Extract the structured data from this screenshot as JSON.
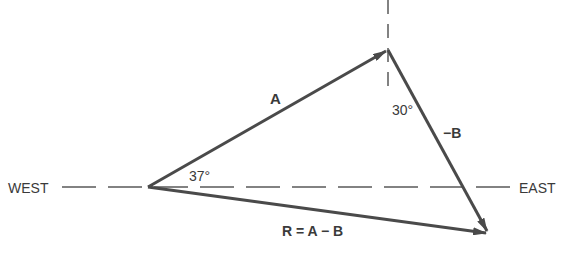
{
  "diagram": {
    "colors": {
      "line": "#4a4a4a",
      "text": "#3a3a3a",
      "background": "#ffffff"
    },
    "axis_labels": {
      "west": "WEST",
      "east": "EAST"
    },
    "vectors": [
      {
        "id": "A",
        "label": "A",
        "from": [
          148,
          187
        ],
        "to": [
          388,
          50
        ]
      },
      {
        "id": "minus_B",
        "label": "−B",
        "from": [
          388,
          50
        ],
        "to": [
          488,
          233
        ]
      },
      {
        "id": "R",
        "label": "R = A − B",
        "from": [
          148,
          187
        ],
        "to": [
          488,
          233
        ]
      }
    ],
    "angles": [
      {
        "label": "37°",
        "description": "Angle of A above west-east line"
      },
      {
        "label": "30°",
        "description": "Angle of -B from vertical"
      }
    ]
  }
}
